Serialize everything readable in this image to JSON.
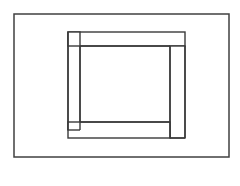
{
  "figure": {
    "background_color": "#ffffff",
    "canvas": {
      "width": 240,
      "height": 186
    },
    "stroke": {
      "color": "#3a3a3a",
      "outer_color": "#404040",
      "width": 1.4,
      "outer_width": 1.5
    },
    "outer_frame": {
      "name": "outer-rectangle",
      "x": 14,
      "y": 14,
      "width": 215,
      "height": 143
    },
    "bars": [
      {
        "name": "left-vertical-bar",
        "orientation": "vertical",
        "x": 68,
        "y": 32,
        "width": 12,
        "height": 98
      },
      {
        "name": "top-horizontal-bar",
        "orientation": "horizontal",
        "x": 68,
        "y": 32,
        "width": 117,
        "height": 14
      },
      {
        "name": "right-vertical-bar",
        "orientation": "vertical",
        "x": 170,
        "y": 46,
        "width": 15,
        "height": 92
      },
      {
        "name": "bottom-horizontal-bar",
        "orientation": "horizontal",
        "x": 68,
        "y": 122,
        "width": 102,
        "height": 16
      }
    ],
    "inner_opening": {
      "name": "central-open-square",
      "x": 80,
      "y": 46,
      "width": 90,
      "height": 76
    },
    "labels": {
      "figure_caption": "",
      "alt_text": "Rectangle containing a square made of four interlocking bars"
    }
  }
}
